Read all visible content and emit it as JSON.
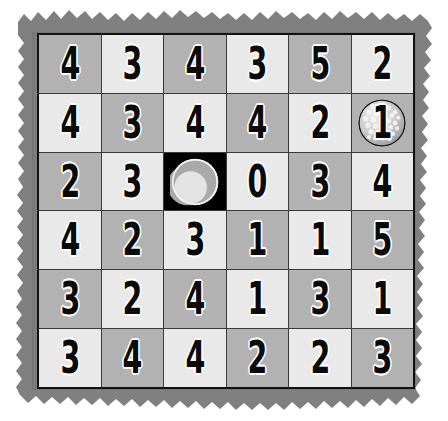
{
  "scene": {
    "name": "number-grid-puzzle-board",
    "description": "torn-paper gray board with a 6x6 checkerboard grid of bold numerals",
    "colors": {
      "paper_border": "#808080",
      "paper_border_shadow": "#6e6e6e",
      "cell_light": "#e9e9e9",
      "cell_dark": "#b2b2b2",
      "cell_black": "#000000",
      "grid_line": "#3a3a3a",
      "frame": "#111111",
      "digit": "#0a0a0a",
      "digit_outline": "#ffffff",
      "ball_light": "#e4e4e4",
      "ball_shade": "#a9a9a9"
    },
    "grid": {
      "rows": 6,
      "columns": 6
    }
  },
  "board": {
    "rows": [
      {
        "index": 1,
        "cells": [
          {
            "value": "4",
            "shade": "dark",
            "ball": "none"
          },
          {
            "value": "3",
            "shade": "light",
            "ball": "none"
          },
          {
            "value": "4",
            "shade": "dark",
            "ball": "none"
          },
          {
            "value": "3",
            "shade": "light",
            "ball": "none"
          },
          {
            "value": "5",
            "shade": "dark",
            "ball": "none"
          },
          {
            "value": "2",
            "shade": "light",
            "ball": "none"
          }
        ]
      },
      {
        "index": 2,
        "cells": [
          {
            "value": "4",
            "shade": "light",
            "ball": "none"
          },
          {
            "value": "3",
            "shade": "dark",
            "ball": "none"
          },
          {
            "value": "4",
            "shade": "light",
            "ball": "none"
          },
          {
            "value": "4",
            "shade": "dark",
            "ball": "none"
          },
          {
            "value": "2",
            "shade": "light",
            "ball": "none"
          },
          {
            "value": "1",
            "shade": "dark",
            "ball": "dimpled-golf-ball"
          }
        ]
      },
      {
        "index": 3,
        "cells": [
          {
            "value": "2",
            "shade": "dark",
            "ball": "none"
          },
          {
            "value": "3",
            "shade": "light",
            "ball": "none"
          },
          {
            "value": "",
            "shade": "black",
            "ball": "plain-golf-ball"
          },
          {
            "value": "0",
            "shade": "light",
            "ball": "none"
          },
          {
            "value": "3",
            "shade": "dark",
            "ball": "none"
          },
          {
            "value": "4",
            "shade": "light",
            "ball": "none"
          }
        ]
      },
      {
        "index": 4,
        "cells": [
          {
            "value": "4",
            "shade": "light",
            "ball": "none"
          },
          {
            "value": "2",
            "shade": "dark",
            "ball": "none"
          },
          {
            "value": "3",
            "shade": "light",
            "ball": "none"
          },
          {
            "value": "1",
            "shade": "dark",
            "ball": "none"
          },
          {
            "value": "1",
            "shade": "light",
            "ball": "none"
          },
          {
            "value": "5",
            "shade": "dark",
            "ball": "none"
          }
        ]
      },
      {
        "index": 5,
        "cells": [
          {
            "value": "3",
            "shade": "dark",
            "ball": "none"
          },
          {
            "value": "2",
            "shade": "light",
            "ball": "none"
          },
          {
            "value": "4",
            "shade": "dark",
            "ball": "none"
          },
          {
            "value": "1",
            "shade": "light",
            "ball": "none"
          },
          {
            "value": "3",
            "shade": "dark",
            "ball": "none"
          },
          {
            "value": "1",
            "shade": "light",
            "ball": "none"
          }
        ]
      },
      {
        "index": 6,
        "cells": [
          {
            "value": "3",
            "shade": "light",
            "ball": "none"
          },
          {
            "value": "4",
            "shade": "dark",
            "ball": "none"
          },
          {
            "value": "4",
            "shade": "light",
            "ball": "none"
          },
          {
            "value": "2",
            "shade": "dark",
            "ball": "none"
          },
          {
            "value": "2",
            "shade": "light",
            "ball": "none"
          },
          {
            "value": "3",
            "shade": "dark",
            "ball": "none"
          }
        ]
      }
    ]
  }
}
